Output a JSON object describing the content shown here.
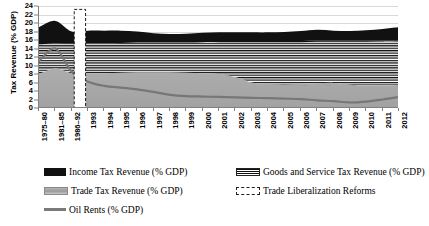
{
  "axes": {
    "ylabel": "Tax Revenue (% GDP)",
    "xlabel": "",
    "y_ticks": [
      "0",
      "2",
      "4",
      "6",
      "8",
      "10",
      "12",
      "14",
      "16",
      "18",
      "20",
      "22",
      "24"
    ],
    "ylim": [
      0,
      24
    ],
    "grid": true
  },
  "legend": {
    "position": "below",
    "items": [
      {
        "label": "Income Tax Revenue (% GDP)",
        "swatch": "solid-black-fill"
      },
      {
        "label": "Trade Tax Revenue (% GDP)",
        "swatch": "solid-gray-fill"
      },
      {
        "label": "Oil Rents (% GDP)",
        "swatch": "gray-line"
      },
      {
        "label": "Goods and Service Tax Revenue (% GDP)",
        "swatch": "horizontal-stripe-fill"
      },
      {
        "label": "Trade Liberalization Reforms",
        "swatch": "dashed-outline-band"
      }
    ]
  },
  "chart_data": {
    "type": "area",
    "title": "",
    "xlabel": "",
    "ylabel": "Tax Revenue (% GDP)",
    "ylim": [
      0,
      24
    ],
    "y_ticks": [
      0,
      2,
      4,
      6,
      8,
      10,
      12,
      14,
      16,
      18,
      20,
      22,
      24
    ],
    "grid": true,
    "stacked": true,
    "categories": [
      "1975–80",
      "1981–85",
      "1986–92",
      "1993",
      "1994",
      "1995",
      "1996",
      "1997",
      "1998",
      "1999",
      "2000",
      "2001",
      "2002",
      "2003",
      "2004",
      "2005",
      "2006",
      "2007",
      "2008",
      "2009",
      "2010",
      "2011",
      "2012"
    ],
    "series": [
      {
        "name": "Trade Tax Revenue (% GDP)",
        "stack_order": 1,
        "fill": "solid-gray",
        "values": [
          8.0,
          9.3,
          8.2,
          8.2,
          8.2,
          8.3,
          8.4,
          8.4,
          8.4,
          8.3,
          8.2,
          8.0,
          7.3,
          6.0,
          5.6,
          5.5,
          5.6,
          5.8,
          5.9,
          5.5,
          5.3,
          5.3,
          5.4
        ]
      },
      {
        "name": "Goods and Service Tax Revenue (% GDP)",
        "stack_order": 2,
        "fill": "horizontal-stripes",
        "values": [
          7.0,
          5.9,
          6.9,
          7.0,
          7.0,
          7.0,
          7.0,
          7.0,
          7.0,
          7.1,
          7.3,
          7.5,
          8.2,
          9.5,
          9.9,
          10.0,
          9.9,
          9.8,
          9.7,
          10.1,
          10.3,
          10.4,
          10.4
        ]
      },
      {
        "name": "Income Tax Revenue (% GDP)",
        "stack_order": 3,
        "fill": "solid-black",
        "values": [
          4.0,
          5.3,
          2.9,
          3.0,
          3.0,
          2.9,
          2.6,
          2.2,
          2.0,
          2.1,
          2.2,
          2.3,
          2.3,
          2.3,
          2.3,
          2.4,
          2.6,
          2.8,
          2.6,
          2.5,
          2.7,
          2.9,
          3.2
        ]
      }
    ],
    "stack_totals": [
      19.0,
      20.5,
      18.0,
      18.2,
      18.2,
      18.2,
      18.0,
      17.6,
      17.4,
      17.5,
      17.7,
      17.8,
      17.8,
      17.8,
      17.8,
      17.9,
      18.1,
      18.4,
      18.2,
      18.1,
      18.3,
      18.6,
      19.0
    ],
    "line_series": [
      {
        "name": "Oil Rents (% GDP)",
        "style": "solid-gray-line",
        "values": [
          11.0,
          14.0,
          8.5,
          6.2,
          5.2,
          4.8,
          4.4,
          3.8,
          3.1,
          2.8,
          2.7,
          2.6,
          2.5,
          2.4,
          2.3,
          2.2,
          2.1,
          1.8,
          1.6,
          1.3,
          1.5,
          2.0,
          2.6
        ]
      }
    ],
    "annotations": [
      {
        "type": "vertical-band",
        "label": "Trade Liberalization Reforms",
        "style": "white-fill-dashed-outline",
        "x_start": "1986–92",
        "x_end": "1993",
        "y_top": 23.2,
        "y_bottom": 0
      }
    ]
  }
}
